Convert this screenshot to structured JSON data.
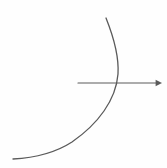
{
  "canvas": {
    "width": 167,
    "height": 168,
    "background_color": "#fefefe",
    "title": "",
    "has_text_labels": false
  },
  "figure": {
    "name": "curve-and-axis-diagram",
    "stroke_color": "#5a5a5a",
    "stroke_width": 1.2,
    "elements": [
      {
        "id": "curve",
        "type": "arc",
        "semantic": "parabolic-curve",
        "description": "Concave-left arc sweeping from upper area down and to the lower left",
        "stroke_color": "#5a5a5a",
        "stroke_width": 1.3,
        "start_point": [
          106,
          18
        ],
        "vertex_point": [
          118,
          70
        ],
        "end_point": [
          13,
          159
        ],
        "path": "M 106 18 C 114 38 119 58 118 74 C 116 100 98 124 72 142 C 55 153 32 158 13 159"
      },
      {
        "id": "axis-line",
        "type": "arrow-line",
        "semantic": "horizontal-axis-arrow",
        "description": "Horizontal straight line with arrowhead marker at right end",
        "stroke_color": "#5a5a5a",
        "stroke_width": 1.2,
        "start_point": [
          78,
          83
        ],
        "end_point": [
          158,
          83
        ],
        "arrowhead_end": "right",
        "arrowhead_size": 4
      }
    ],
    "intersection_point": [
      115,
      83
    ]
  }
}
